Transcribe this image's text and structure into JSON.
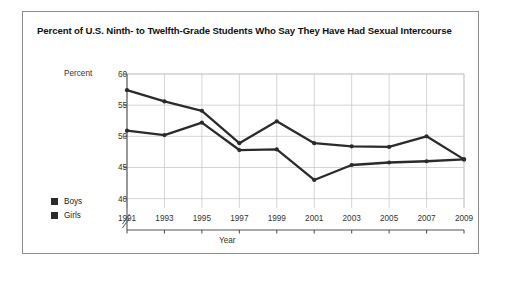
{
  "figure": {
    "title": "Percent of U.S. Ninth- to Twelfth-Grade Students Who Say They Have Had Sexual Intercourse"
  },
  "chart_data": {
    "type": "line",
    "title": "Percent of U.S. Ninth- to Twelfth-Grade Students Who Say They Have Had Sexual Intercourse",
    "xlabel": "Year",
    "ylabel": "Percent",
    "categories": [
      "1991",
      "1993",
      "1995",
      "1997",
      "1999",
      "2001",
      "2003",
      "2005",
      "2007",
      "2009"
    ],
    "x": [
      1991,
      1993,
      1995,
      1997,
      1999,
      2001,
      2003,
      2005,
      2007,
      2009
    ],
    "series": [
      {
        "name": "Boys",
        "color": "#2b2b2b",
        "values": [
          57.4,
          55.6,
          54.1,
          48.9,
          52.4,
          48.9,
          48.4,
          48.3,
          50.0,
          46.3
        ]
      },
      {
        "name": "Girls",
        "color": "#2b2b2b",
        "values": [
          50.9,
          50.2,
          52.2,
          47.8,
          47.9,
          43.0,
          45.4,
          45.8,
          46.0,
          46.3
        ]
      }
    ],
    "yticks": [
      40,
      45,
      50,
      55,
      60
    ],
    "ylim": [
      38.5,
      60
    ],
    "axis_break": true,
    "grid": true,
    "legend_position": "left-outside"
  },
  "legend": {
    "items": [
      {
        "label": "Boys"
      },
      {
        "label": "Girls"
      }
    ]
  }
}
